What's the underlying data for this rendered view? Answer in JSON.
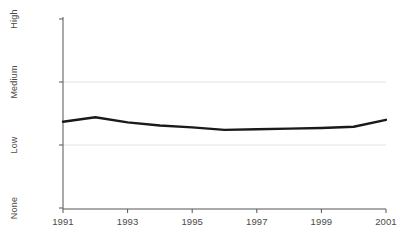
{
  "chart_data": {
    "type": "line",
    "title": "",
    "subtitle": "",
    "xlabel": "",
    "ylabel": "",
    "x": [
      1991,
      1992,
      1993,
      1994,
      1995,
      1996,
      1997,
      1998,
      1999,
      2000,
      2001
    ],
    "series": [
      {
        "name": "",
        "values": [
          1.37,
          1.44,
          1.36,
          1.31,
          1.28,
          1.24,
          1.25,
          1.26,
          1.27,
          1.29,
          1.4
        ]
      }
    ],
    "xlim": [
      1991,
      2001
    ],
    "ylim": [
      0,
      3
    ],
    "xticks": [
      1991,
      1993,
      1995,
      1997,
      1999,
      2001
    ],
    "xticklabels": [
      "1991",
      "1993",
      "1995",
      "1997",
      "1999",
      "2001"
    ],
    "yticks": [
      0,
      1,
      2,
      3
    ],
    "yticklabels": [
      "None",
      "Low",
      "Medium",
      "High"
    ],
    "grid": "horizontal",
    "gridlines_at": [
      1,
      2
    ],
    "legend": "none",
    "line_color": "#1a1a1a",
    "line_width": 2.4,
    "axis_color": "#555555",
    "grid_color": "#e2e2e2",
    "background_color": "#ffffff"
  }
}
